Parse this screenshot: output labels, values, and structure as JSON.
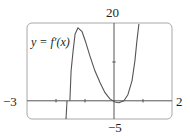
{
  "chart_data": {
    "type": "line",
    "title": "",
    "xlabel": "",
    "ylabel": "",
    "xlim": [
      -3,
      2
    ],
    "ylim": [
      -5,
      20
    ],
    "grid": false,
    "legend": null,
    "annotations": [
      {
        "text": "y = f′(x)",
        "position": "upper-left"
      }
    ],
    "tick_labels": {
      "x_min": "−3",
      "x_max": "2",
      "y_max": "20",
      "y_min": "−5"
    },
    "x_ticks": [
      -2,
      -1,
      1
    ],
    "y_ticks": [
      10
    ],
    "series": [
      {
        "name": "y = f′(x)",
        "x": [
          -1.52,
          -1.48,
          -1.41,
          -1.34,
          -1.24,
          -1.1,
          -0.97,
          -0.83,
          -0.66,
          -0.48,
          -0.31,
          -0.14,
          0.03,
          0.17,
          0.34,
          0.48,
          0.62,
          0.72,
          0.79,
          0.86
        ],
        "y": [
          0.0,
          7.8,
          13.0,
          17.4,
          19.0,
          18.0,
          15.1,
          11.7,
          7.8,
          4.7,
          2.1,
          0.5,
          -0.3,
          -0.5,
          0.0,
          1.6,
          5.2,
          10.4,
          15.6,
          20.0
        ]
      }
    ]
  },
  "labels": {
    "x_min": "−3",
    "x_max": "2",
    "y_max": "20",
    "y_min": "−5",
    "function": "y = f′(x)"
  },
  "colors": {
    "frame": "#a8a8a8",
    "axes": "#555555",
    "curve": "#555555",
    "text": "#231f20"
  }
}
